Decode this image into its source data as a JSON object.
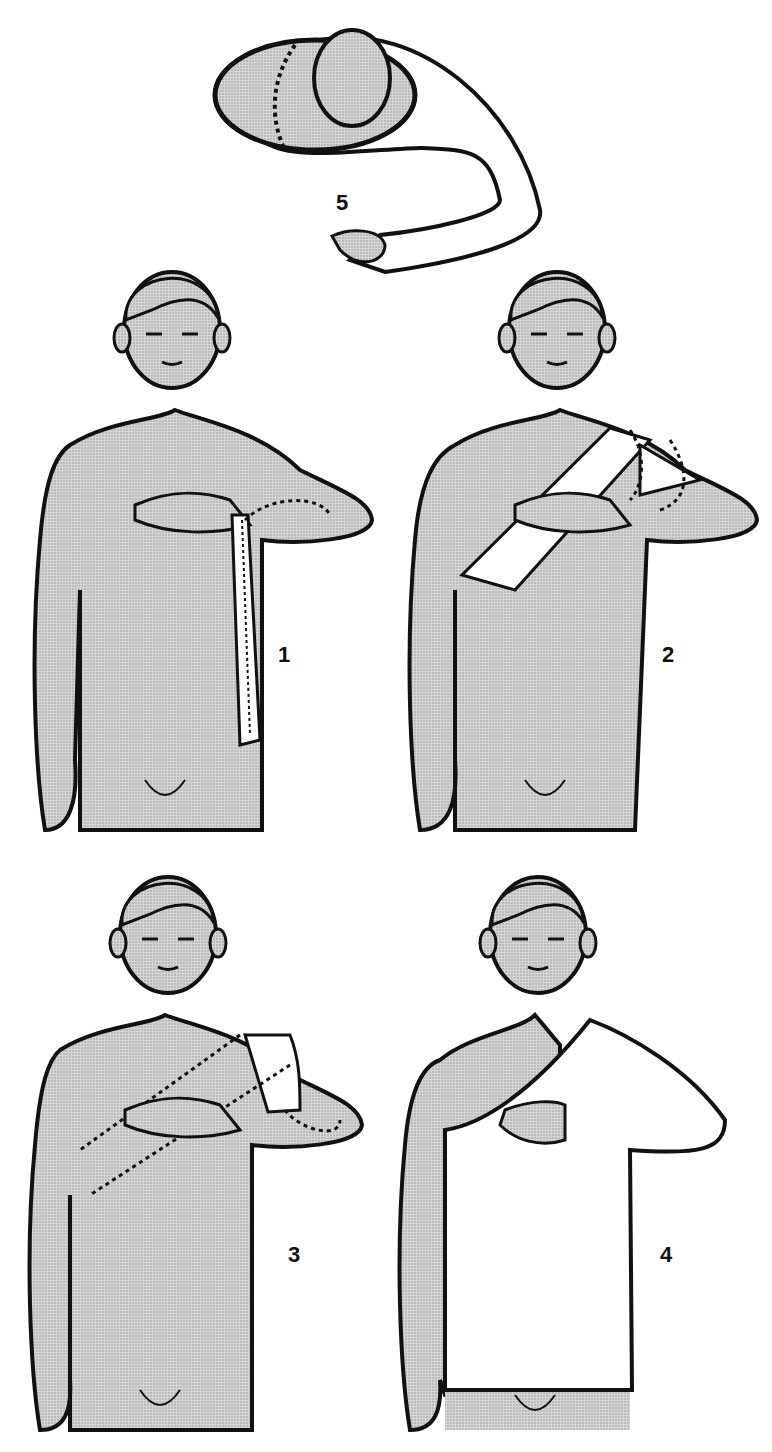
{
  "figure": {
    "colors": {
      "skin_stipple": "#c8c8c8",
      "outline": "#111111",
      "bandage": "#ffffff",
      "background": "#ffffff"
    }
  },
  "steps": [
    {
      "number": "5",
      "view": "top-down view, arm wrapped across chest"
    },
    {
      "number": "1",
      "view": "front, bandage strip hanging from forearm"
    },
    {
      "number": "2",
      "view": "front, bandage strip diagonal across chest over shoulder"
    },
    {
      "number": "3",
      "view": "front, bandage folded (dotted outline) across chest"
    },
    {
      "number": "4",
      "view": "front, arm and torso covered by bandage"
    }
  ]
}
